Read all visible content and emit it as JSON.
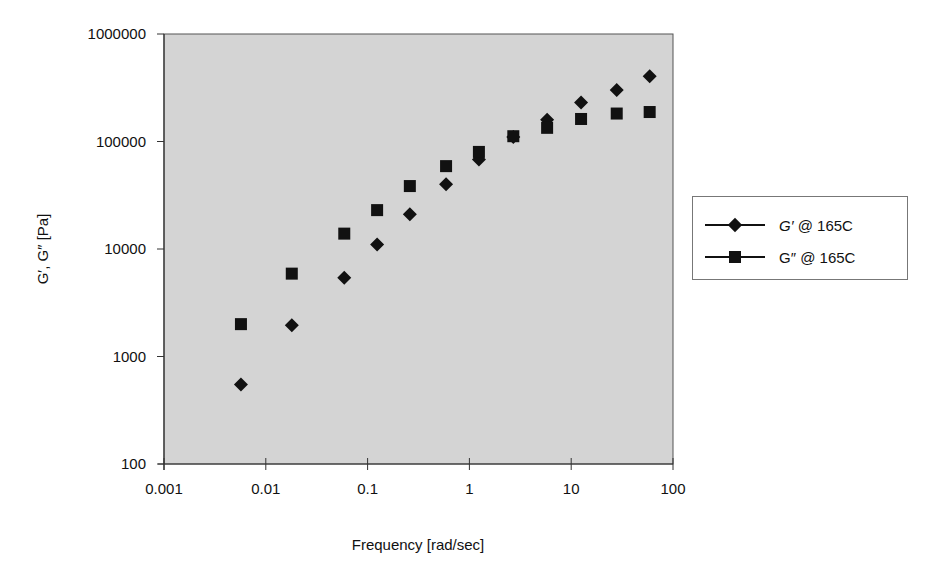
{
  "chart_data": {
    "type": "scatter",
    "title": "",
    "xlabel": "Frequency [rad/sec]",
    "ylabel": "G′, G″ [Pa]",
    "xscale": "log",
    "yscale": "log",
    "xlim": [
      0.001,
      100
    ],
    "ylim": [
      100,
      1000000
    ],
    "x_ticks": [
      "0.001",
      "0.01",
      "0.1",
      "1",
      "10",
      "100"
    ],
    "y_ticks": [
      "100",
      "1000",
      "10000",
      "100000",
      "1000000"
    ],
    "grid": false,
    "plot_background": "#d4d4d4",
    "legend_position": "right",
    "series": [
      {
        "name": "G′ @ 165C",
        "marker": "diamond",
        "color": "#111111",
        "x": [
          0.0057,
          0.018,
          0.059,
          0.124,
          0.26,
          0.59,
          1.24,
          2.7,
          5.8,
          12.5,
          28,
          59
        ],
        "y": [
          550,
          1950,
          5400,
          11000,
          21000,
          40000,
          68000,
          110000,
          159000,
          230000,
          302000,
          405000
        ]
      },
      {
        "name": "G″ @ 165C",
        "marker": "square",
        "color": "#111111",
        "x": [
          0.0057,
          0.018,
          0.059,
          0.124,
          0.26,
          0.59,
          1.24,
          2.7,
          5.8,
          12.5,
          28,
          59
        ],
        "y": [
          2000,
          5900,
          13900,
          23000,
          38500,
          59000,
          80000,
          112000,
          134000,
          162000,
          182000,
          188000
        ]
      }
    ]
  },
  "legend": {
    "items": [
      {
        "label_symbol": "G′",
        "label_rest": " @ 165C",
        "marker": "diamond"
      },
      {
        "label_symbol": "G″",
        "label_rest": " @ 165C",
        "marker": "square"
      }
    ]
  }
}
